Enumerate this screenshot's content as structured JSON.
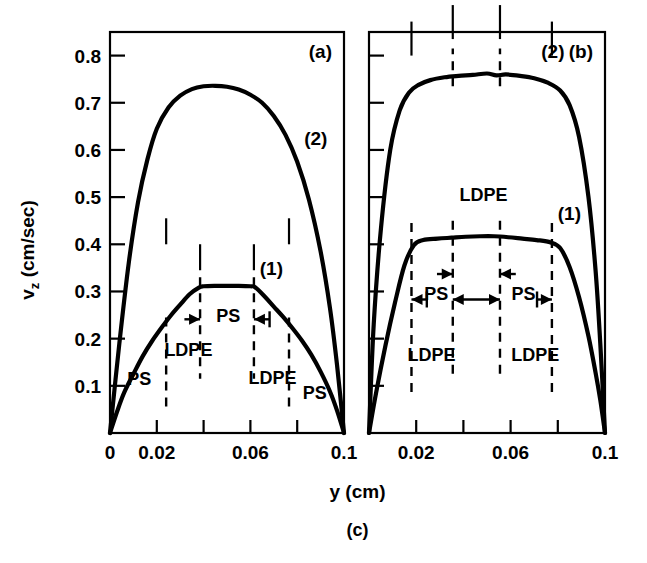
{
  "figure": {
    "caption": "(c)",
    "xlabel": "y (cm)",
    "ylabel_main": "v",
    "ylabel_sub": "z",
    "ylabel_unit": " (cm/sec)"
  },
  "chart_data": {
    "type": "line",
    "title": "",
    "xlabel": "y (cm)",
    "ylabel": "v_z (cm/sec)",
    "caption": "(c)",
    "xlim": [
      0,
      0.1
    ],
    "ylim": [
      0,
      0.85
    ],
    "grid": false,
    "legend_position": "inline-annotations",
    "panels": [
      {
        "tag": "(a)",
        "x_ticks": [
          0,
          0.02,
          0.04,
          0.06,
          0.08,
          0.1
        ],
        "x_tick_labels": [
          "0",
          "0.02",
          "",
          "0.06",
          "",
          "0.1"
        ],
        "y_ticks": [
          0.1,
          0.2,
          0.3,
          0.4,
          0.5,
          0.6,
          0.7,
          0.8
        ],
        "y_tick_labels": [
          "0.1",
          "0.2",
          "0.3",
          "0.4",
          "0.5",
          "0.6",
          "0.7",
          "0.8"
        ],
        "series": [
          {
            "name": "(2)",
            "label": "(2)",
            "x": [
              0.0,
              0.004,
              0.008,
              0.012,
              0.016,
              0.02,
              0.025,
              0.03,
              0.035,
              0.04,
              0.045,
              0.05,
              0.055,
              0.06,
              0.065,
              0.07,
              0.075,
              0.08,
              0.085,
              0.09,
              0.094,
              0.097,
              0.1
            ],
            "y": [
              0.0,
              0.19,
              0.36,
              0.49,
              0.58,
              0.645,
              0.69,
              0.715,
              0.729,
              0.735,
              0.736,
              0.734,
              0.728,
              0.717,
              0.7,
              0.672,
              0.632,
              0.575,
              0.495,
              0.385,
              0.265,
              0.145,
              0.0
            ]
          },
          {
            "name": "(1)",
            "label": "(1)",
            "x": [
              0.0,
              0.003,
              0.006,
              0.01,
              0.014,
              0.018,
              0.022,
              0.026,
              0.03,
              0.034,
              0.038,
              0.04,
              0.045,
              0.05,
              0.055,
              0.06,
              0.062,
              0.066,
              0.07,
              0.074,
              0.078,
              0.082,
              0.086,
              0.09,
              0.094,
              0.097,
              0.1
            ],
            "y": [
              0.0,
              0.045,
              0.085,
              0.125,
              0.163,
              0.195,
              0.223,
              0.249,
              0.272,
              0.294,
              0.308,
              0.311,
              0.312,
              0.312,
              0.312,
              0.311,
              0.309,
              0.29,
              0.268,
              0.246,
              0.222,
              0.196,
              0.166,
              0.13,
              0.088,
              0.048,
              0.0
            ]
          }
        ],
        "region_boundaries": [
          0.024,
          0.0385,
          0.0615,
          0.0765
        ],
        "region_labels": [
          {
            "text": "PS",
            "x": 0.0125,
            "y": 0.102
          },
          {
            "text": "LDPE",
            "x": 0.0335,
            "y": 0.164
          },
          {
            "text": "PS",
            "x": 0.0505,
            "y": 0.236
          },
          {
            "text": "LDPE",
            "x": 0.0695,
            "y": 0.103
          },
          {
            "text": "PS",
            "x": 0.0875,
            "y": 0.072
          }
        ]
      },
      {
        "tag": "(b)",
        "x_ticks": [
          0,
          0.02,
          0.04,
          0.06,
          0.08,
          0.1
        ],
        "x_tick_labels": [
          "",
          "0.02",
          "",
          "0.06",
          "",
          "0.1"
        ],
        "y_ticks": [
          0.1,
          0.2,
          0.3,
          0.4,
          0.5,
          0.6,
          0.7,
          0.8
        ],
        "y_tick_labels": [
          "",
          "",
          "",
          "",
          "",
          "",
          "",
          ""
        ],
        "series": [
          {
            "name": "(2)",
            "label": "(2)",
            "x": [
              0.0,
              0.002,
              0.005,
              0.009,
              0.013,
              0.017,
              0.021,
              0.026,
              0.032,
              0.038,
              0.044,
              0.05,
              0.054,
              0.058,
              0.064,
              0.07,
              0.076,
              0.081,
              0.085,
              0.089,
              0.093,
              0.096,
              0.098,
              0.1
            ],
            "y": [
              0.0,
              0.23,
              0.43,
              0.6,
              0.684,
              0.722,
              0.738,
              0.748,
              0.754,
              0.757,
              0.759,
              0.762,
              0.758,
              0.76,
              0.757,
              0.752,
              0.742,
              0.726,
              0.695,
              0.628,
              0.5,
              0.345,
              0.19,
              0.0
            ]
          },
          {
            "name": "(1)",
            "label": "(1)",
            "x": [
              0.0,
              0.003,
              0.007,
              0.011,
              0.015,
              0.019,
              0.023,
              0.029,
              0.035,
              0.041,
              0.047,
              0.053,
              0.059,
              0.065,
              0.071,
              0.077,
              0.081,
              0.085,
              0.089,
              0.093,
              0.096,
              0.098,
              0.1
            ],
            "y": [
              0.0,
              0.085,
              0.186,
              0.276,
              0.355,
              0.398,
              0.409,
              0.412,
              0.414,
              0.416,
              0.417,
              0.417,
              0.415,
              0.412,
              0.409,
              0.404,
              0.392,
              0.352,
              0.288,
              0.205,
              0.128,
              0.07,
              0.0
            ]
          }
        ],
        "region_boundaries": [
          0.018,
          0.0355,
          0.0555,
          0.0775
        ],
        "region_labels": [
          {
            "text": "LDPE",
            "x": 0.0265,
            "y": 0.153
          },
          {
            "text": "PS",
            "x": 0.0285,
            "y": 0.282
          },
          {
            "text": "PS",
            "x": 0.0655,
            "y": 0.282
          },
          {
            "text": "LDPE",
            "x": 0.0705,
            "y": 0.153
          },
          {
            "text": "LDPE",
            "x": 0.0485,
            "y": 0.492
          }
        ]
      }
    ]
  }
}
